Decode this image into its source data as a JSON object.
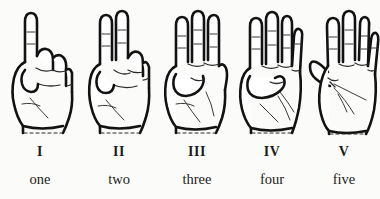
{
  "figure": {
    "background_color": "#fbfbf9",
    "ink_color": "#121212",
    "style": "line-art scanned illustration"
  },
  "items": [
    {
      "numeral": "I",
      "word": "one",
      "count": 1,
      "gesture": "closed fist with index finger extended upward",
      "extended_fingers": [
        "index"
      ],
      "icon": "hand-one-icon"
    },
    {
      "numeral": "II",
      "word": "two",
      "count": 2,
      "gesture": "closed fist with index and middle fingers extended upward",
      "extended_fingers": [
        "index",
        "middle"
      ],
      "icon": "hand-two-icon"
    },
    {
      "numeral": "III",
      "word": "three",
      "count": 3,
      "gesture": "closed fist with index, middle and ring fingers extended upward",
      "extended_fingers": [
        "index",
        "middle",
        "ring"
      ],
      "icon": "hand-three-icon"
    },
    {
      "numeral": "IV",
      "word": "four",
      "count": 4,
      "gesture": "four fingers extended upward with thumb folded across palm",
      "extended_fingers": [
        "index",
        "middle",
        "ring",
        "little"
      ],
      "icon": "hand-four-icon"
    },
    {
      "numeral": "V",
      "word": "five",
      "count": 5,
      "gesture": "open palm with all five digits extended and spread",
      "extended_fingers": [
        "thumb",
        "index",
        "middle",
        "ring",
        "little"
      ],
      "icon": "hand-five-icon"
    }
  ]
}
